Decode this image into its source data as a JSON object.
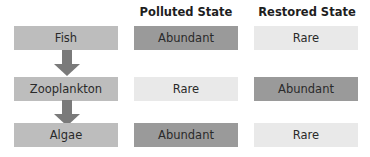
{
  "headers": {
    "polluted": "Polluted State",
    "restored": "Restored State"
  },
  "food_chain": [
    {
      "label": "Fish",
      "polluted": "Abundant",
      "restored": "Rare"
    },
    {
      "label": "Zooplankton",
      "polluted": "Rare",
      "restored": "Abundant"
    },
    {
      "label": "Algae",
      "polluted": "Abundant",
      "restored": "Rare"
    }
  ],
  "colors": {
    "abundant": "#9a9a9a",
    "rare": "#e9e9e9",
    "organism": "#bdbdbd",
    "arrow": "#7a7a7a"
  }
}
